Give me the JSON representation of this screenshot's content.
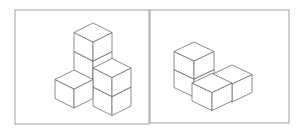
{
  "diagram": {
    "title": "",
    "stroke_color": "#6e6e6e",
    "frame_color": "#9a9a9a",
    "figures": [
      {
        "name": "left-cube-structure",
        "cube_count": 5
      },
      {
        "name": "right-cube-structure",
        "cube_count": 4
      }
    ]
  }
}
